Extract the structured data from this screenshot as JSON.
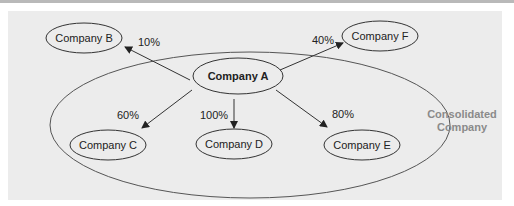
{
  "diagram": {
    "parent": {
      "label": "Company A"
    },
    "nodes": [
      {
        "id": "B",
        "label": "Company B",
        "ownership": "10%",
        "consolidated": false
      },
      {
        "id": "F",
        "label": "Company F",
        "ownership": "40%",
        "consolidated": false
      },
      {
        "id": "C",
        "label": "Company C",
        "ownership": "60%",
        "consolidated": true
      },
      {
        "id": "D",
        "label": "Company D",
        "ownership": "100%",
        "consolidated": true
      },
      {
        "id": "E",
        "label": "Company E",
        "ownership": "80%",
        "consolidated": true
      }
    ],
    "group_label_line1": "Consolidated",
    "group_label_line2": "Company",
    "colors": {
      "background": "#ececec",
      "stroke": "#333333",
      "group_label": "#8a8a8a"
    }
  }
}
